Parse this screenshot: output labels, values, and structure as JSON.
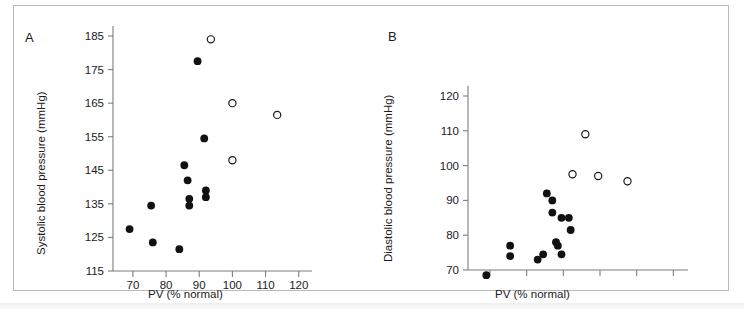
{
  "figure": {
    "background_color": "#ffffff",
    "border_color": "#b9b9b9",
    "marker_filled_color": "#111111",
    "marker_open_color": "#ffffff",
    "axis_color": "#7d7d7d",
    "text_color": "#1b1b1b"
  },
  "panels": {
    "a": {
      "label": "A"
    },
    "b": {
      "label": "B"
    }
  },
  "chart_data": [
    {
      "type": "scatter",
      "panel": "A",
      "title": "",
      "xlabel": "PV (% normal)",
      "ylabel": "Systolic blood pressure (mmHg)",
      "xlim": [
        64,
        124
      ],
      "ylim": [
        115,
        188
      ],
      "xticks": [
        70,
        80,
        90,
        100,
        110,
        120
      ],
      "xtick_labels": [
        "70",
        "80",
        "90",
        "100",
        "110",
        "120"
      ],
      "yticks": [
        115,
        125,
        135,
        145,
        155,
        165,
        175,
        185
      ],
      "ytick_labels": [
        "115",
        "125",
        "135",
        "145",
        "155",
        "165",
        "175",
        "185"
      ],
      "grid": false,
      "legend": "none",
      "series": [
        {
          "name": "filled",
          "marker": "filled-circle",
          "points": [
            [
              69.0,
              127.5
            ],
            [
              75.5,
              134.5
            ],
            [
              76.0,
              123.5
            ],
            [
              84.0,
              121.5
            ],
            [
              85.5,
              146.5
            ],
            [
              86.5,
              142.0
            ],
            [
              87.0,
              136.5
            ],
            [
              87.0,
              134.5
            ],
            [
              89.5,
              177.5
            ],
            [
              91.5,
              154.5
            ],
            [
              92.0,
              139.0
            ],
            [
              92.0,
              137.0
            ]
          ]
        },
        {
          "name": "open",
          "marker": "open-circle",
          "points": [
            [
              93.5,
              184.0
            ],
            [
              100.0,
              165.0
            ],
            [
              100.0,
              148.0
            ],
            [
              113.5,
              161.5
            ]
          ]
        }
      ]
    },
    {
      "type": "scatter",
      "panel": "B",
      "title": "",
      "xlabel": "PV (% normal)",
      "ylabel": "Diastolic blood pressure (mmHg)",
      "xlim": [
        64,
        124
      ],
      "ylim": [
        63,
        124
      ],
      "xticks": [
        70,
        80,
        90,
        100,
        110,
        120
      ],
      "xtick_labels": [
        "",
        "",
        "",
        "",
        "",
        ""
      ],
      "yticks": [
        70,
        80,
        90,
        100,
        110,
        120
      ],
      "ytick_labels": [
        "70",
        "80",
        "90",
        "100",
        "110",
        "120"
      ],
      "grid": false,
      "legend": "none",
      "series": [
        {
          "name": "filled",
          "marker": "filled-circle",
          "points": [
            [
              69.0,
              68.5
            ],
            [
              75.5,
              77.0
            ],
            [
              75.5,
              74.0
            ],
            [
              83.0,
              73.0
            ],
            [
              84.5,
              74.5
            ],
            [
              85.5,
              92.0
            ],
            [
              87.0,
              90.0
            ],
            [
              87.0,
              86.5
            ],
            [
              88.5,
              77.0
            ],
            [
              89.5,
              74.5
            ],
            [
              89.5,
              85.0
            ],
            [
              91.5,
              85.0
            ],
            [
              92.0,
              81.5
            ],
            [
              88.0,
              78.0
            ]
          ]
        },
        {
          "name": "open",
          "marker": "open-circle",
          "points": [
            [
              92.5,
              97.5
            ],
            [
              96.0,
              109.0
            ],
            [
              99.5,
              97.0
            ],
            [
              107.5,
              95.5
            ]
          ]
        }
      ]
    }
  ]
}
